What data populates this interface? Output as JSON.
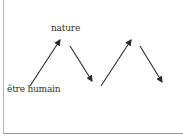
{
  "diagram": {
    "labels": {
      "top": "nature",
      "bottom": "être humain"
    },
    "arrows": [
      {
        "id": 1,
        "direction": "up",
        "from": "être humain",
        "to": "nature"
      },
      {
        "id": 2,
        "direction": "down"
      },
      {
        "id": 3,
        "direction": "up"
      },
      {
        "id": 4,
        "direction": "down"
      }
    ],
    "colors": {
      "arrow": "#2a2a2a",
      "text": "#333333",
      "frame": "#a8a8a8"
    }
  }
}
